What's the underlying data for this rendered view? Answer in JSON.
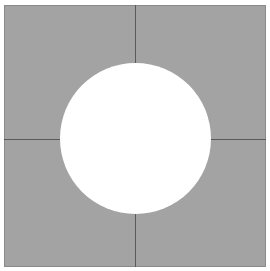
{
  "figure": {
    "type": "square-with-inscribed-circle",
    "colors": {
      "background": "#ffffff",
      "square_fill": "#a3a3a3",
      "divider_lines": "#5a5a5a",
      "circle_fill": "#ffffff"
    },
    "square": {
      "x": 4,
      "y": 5,
      "size": 262
    },
    "circle": {
      "cx": 135,
      "cy": 138,
      "r": 75
    },
    "dividers": {
      "vertical_x": 135,
      "horizontal_y": 139
    },
    "quadrants": [
      "top-left",
      "top-right",
      "bottom-left",
      "bottom-right"
    ]
  }
}
